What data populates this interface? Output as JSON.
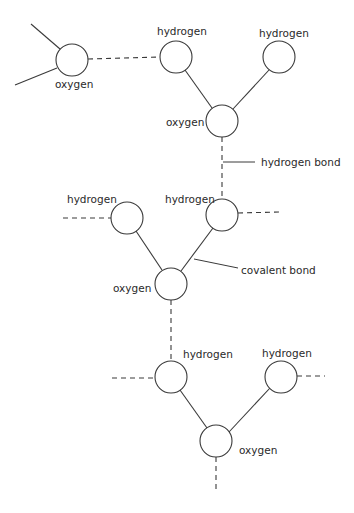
{
  "diagram": {
    "type": "water-molecule-hydrogen-bonding",
    "colors": {
      "stroke": "#3a3a3a",
      "text": "#2a2a2a",
      "background": "#ffffff"
    },
    "molecules": [
      {
        "id": "m1",
        "oxygen": {
          "label": "oxygen",
          "cx": 72,
          "cy": 60
        },
        "hydrogens": []
      },
      {
        "id": "m2",
        "oxygen": {
          "label": "oxygen",
          "cx": 222,
          "cy": 121
        },
        "hydrogens": [
          {
            "label": "hydrogen",
            "cx": 176,
            "cy": 57
          },
          {
            "label": "hydrogen",
            "cx": 279,
            "cy": 57
          }
        ]
      },
      {
        "id": "m3",
        "oxygen": {
          "label": "oxygen",
          "cx": 171,
          "cy": 284
        },
        "hydrogens": [
          {
            "label": "hydrogen",
            "cx": 127,
            "cy": 218
          },
          {
            "label": "hydrogen",
            "cx": 222,
            "cy": 215
          }
        ]
      },
      {
        "id": "m4",
        "oxygen": {
          "label": "oxygen",
          "cx": 216,
          "cy": 441
        },
        "hydrogens": [
          {
            "label": "hydrogen",
            "cx": 171,
            "cy": 377
          },
          {
            "label": "hydrogen",
            "cx": 281,
            "cy": 377
          }
        ]
      }
    ],
    "annotations": {
      "hydrogen_bond": "hydrogen bond",
      "covalent_bond": "covalent bond"
    },
    "labels": {
      "m1_oxygen": "oxygen",
      "m2_oxygen": "oxygen",
      "m2_h_left": "hydrogen",
      "m2_h_right": "hydrogen",
      "m3_oxygen": "oxygen",
      "m3_h_left": "hydrogen",
      "m3_h_right": "hydrogen",
      "m4_oxygen": "oxygen",
      "m4_h_left": "hydrogen",
      "m4_h_right": "hydrogen"
    }
  }
}
